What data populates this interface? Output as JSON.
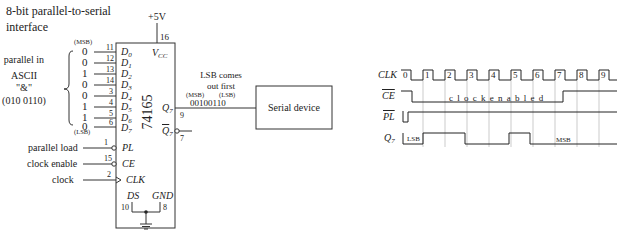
{
  "title": {
    "line1": "8-bit parallel-to-serial",
    "line2": "interface"
  },
  "power": {
    "label": "+5V",
    "vcc_pin": "16",
    "vcc_label": "V",
    "vcc_sub": "CC"
  },
  "chip": {
    "name": "74165"
  },
  "parallel_in": {
    "msb_label": "(MSB)",
    "lsb_label": "(LSB)",
    "description": [
      "parallel in",
      "ASCII",
      "\"&\"",
      "(010 0110)"
    ],
    "bits": [
      "0",
      "0",
      "1",
      "0",
      "0",
      "1",
      "1",
      "0"
    ],
    "pins": [
      "11",
      "12",
      "13",
      "14",
      "3",
      "4",
      "5",
      "6"
    ],
    "inputs": [
      "D",
      "D",
      "D",
      "D",
      "D",
      "D",
      "D",
      "D"
    ],
    "input_subs": [
      "0",
      "1",
      "2",
      "3",
      "4",
      "5",
      "6",
      "7"
    ]
  },
  "controls": [
    {
      "label": "parallel load",
      "pin": "1",
      "name": "PL"
    },
    {
      "label": "clock enable",
      "pin": "15",
      "name": "CE"
    },
    {
      "label": "clock",
      "pin": "2",
      "name": "CLK"
    }
  ],
  "bottom_pins": {
    "ds_label": "DS",
    "ds_pin": "10",
    "gnd_label": "GND",
    "gnd_pin": "8"
  },
  "outputs": {
    "q7": "Q",
    "q7_sub": "7",
    "q7_pin": "9",
    "q7n_pin": "7"
  },
  "serial_out": {
    "note_line1": "LSB comes",
    "note_line2": "out first",
    "msb_label": "(MSB)",
    "lsb_label": "(LSB)",
    "value": "00100110"
  },
  "serial_device": {
    "label": "Serial device"
  },
  "timing": {
    "signals": [
      "CLK",
      "CE",
      "PL",
      "Q"
    ],
    "q_sub": "7",
    "clock_numbers": [
      "0",
      "1",
      "2",
      "3",
      "4",
      "5",
      "6",
      "7",
      "8",
      "9"
    ],
    "ce_note": "c l o c k   e n a b l e d",
    "q_labels": {
      "lsb": "LSB",
      "msb": "MSB"
    }
  }
}
